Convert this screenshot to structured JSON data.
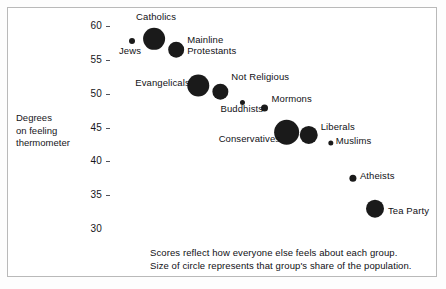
{
  "chart_data": {
    "type": "scatter",
    "title": "",
    "subtitle": "",
    "xlabel": "",
    "ylabel": "Degrees on feeling thermometer",
    "ylabel_lines": [
      "Degrees",
      "on feeling",
      "thermometer"
    ],
    "ylim": [
      28,
      61
    ],
    "yticks": [
      30,
      35,
      40,
      45,
      50,
      55,
      60
    ],
    "ytick_labels": [
      "30",
      "35",
      "40",
      "45",
      "50",
      "55",
      "60"
    ],
    "xlim": [
      0,
      13
    ],
    "xticks": [],
    "xtick_labels": [],
    "grid": false,
    "legend": "none",
    "size_encoding": "circle area represents that group's share of the population",
    "points": [
      {
        "label": "Jews",
        "x": 1,
        "y": 57.8,
        "size": 3.0,
        "label_dx": -13,
        "label_dy": 9,
        "label_lines": [
          "Jews"
        ]
      },
      {
        "label": "Catholics",
        "x": 2,
        "y": 58.1,
        "size": 11.0,
        "label_dx": -18,
        "label_dy": -23,
        "label_lines": [
          "Catholics"
        ]
      },
      {
        "label": "Mainline Protestants",
        "x": 3,
        "y": 56.5,
        "size": 8.0,
        "label_dx": 11,
        "label_dy": -11,
        "label_lines": [
          "Mainline",
          "Protestants"
        ]
      },
      {
        "label": "Evangelicals",
        "x": 4,
        "y": 51.2,
        "size": 11.0,
        "label_dx": -63,
        "label_dy": -4,
        "label_lines": [
          "Evangelicals"
        ]
      },
      {
        "label": "Not Religious",
        "x": 5,
        "y": 50.3,
        "size": 8.0,
        "label_dx": 11,
        "label_dy": -16,
        "label_lines": [
          "Not Religious"
        ]
      },
      {
        "label": "Buddhists",
        "x": 6,
        "y": 48.7,
        "size": 2.5,
        "label_dx": -22,
        "label_dy": 6,
        "label_lines": [
          "Buddhists"
        ]
      },
      {
        "label": "Mormons",
        "x": 7,
        "y": 47.9,
        "size": 3.5,
        "label_dx": 7,
        "label_dy": -10,
        "label_lines": [
          "Mormons"
        ]
      },
      {
        "label": "Conservatives",
        "x": 8,
        "y": 44.3,
        "size": 12.5,
        "label_dx": -68,
        "label_dy": 6,
        "label_lines": [
          "Conservatives"
        ]
      },
      {
        "label": "Liberals",
        "x": 9,
        "y": 43.9,
        "size": 9.0,
        "label_dx": 12,
        "label_dy": -9,
        "label_lines": [
          "Liberals"
        ]
      },
      {
        "label": "Muslims",
        "x": 10,
        "y": 42.7,
        "size": 2.5,
        "label_dx": 5,
        "label_dy": -3,
        "label_lines": [
          "Muslims"
        ]
      },
      {
        "label": "Atheists",
        "x": 11,
        "y": 37.5,
        "size": 3.5,
        "label_dx": 7,
        "label_dy": -3,
        "label_lines": [
          "Atheists"
        ]
      },
      {
        "label": "Tea Party",
        "x": 12,
        "y": 33.0,
        "size": 9.0,
        "label_dx": 13,
        "label_dy": 1,
        "label_lines": [
          "Tea Party"
        ]
      }
    ]
  },
  "caption": {
    "line1": "Scores reflect how everyone else feels about each group.",
    "line2": "Size of circle represents that group's share of the population."
  },
  "colors": {
    "bubble": "#1a1a1a",
    "text": "#16161a",
    "frame": "#b9b9b9",
    "background": "#ffffff"
  }
}
